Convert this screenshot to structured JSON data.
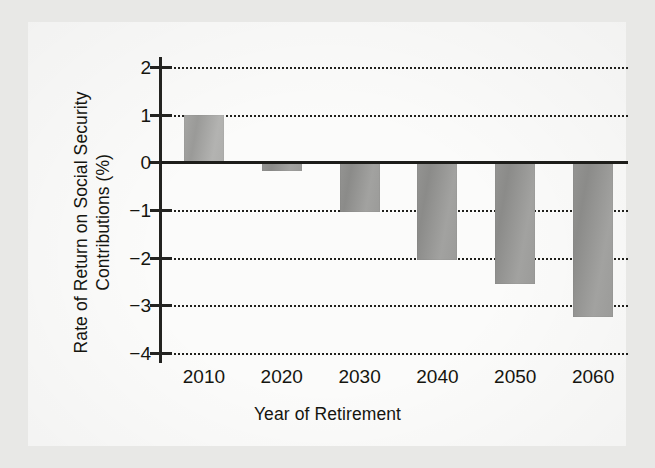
{
  "figure": {
    "background_color": "#e8e8e6",
    "plate_color": "#fbfbfa",
    "ink_color": "#15150f",
    "bar_color": "#9a9a98"
  },
  "chart_data": {
    "type": "bar",
    "title": "",
    "xlabel": "Year of Retirement",
    "ylabel": "Rate of Return on Social Security\nContributions (%)",
    "categories": [
      "2010",
      "2020",
      "2030",
      "2040",
      "2050",
      "2060"
    ],
    "values": [
      1.0,
      -0.19,
      -1.05,
      -2.05,
      -2.56,
      -3.25
    ],
    "series": [
      {
        "name": "Rate of Return on Social Security Contributions (%)",
        "values": [
          1.0,
          -0.19,
          -1.05,
          -2.05,
          -2.56,
          -3.25
        ]
      }
    ],
    "ylim": [
      -4,
      2
    ],
    "yticks": [
      2,
      1,
      0,
      -1,
      -2,
      -3,
      -4
    ],
    "ytick_labels": [
      "2",
      "1",
      "0",
      "−1",
      "−2",
      "−3",
      "−4"
    ],
    "xticks": [
      "2010",
      "2020",
      "2030",
      "2040",
      "2050",
      "2060"
    ],
    "grid": "horizontal-dotted",
    "gridlines_at": [
      2,
      1,
      -1,
      -2,
      -3,
      -4
    ],
    "legend": "none",
    "zero_reference_line": 0
  }
}
